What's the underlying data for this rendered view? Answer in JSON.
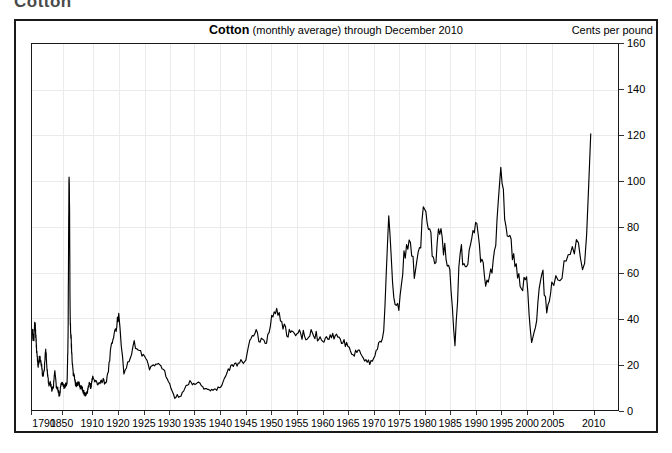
{
  "page": {
    "clipped_heading": "Cotton"
  },
  "chart_frame": {
    "title_series": "Cotton",
    "title_detail": "(monthly average) through December 2010",
    "unit_label": "Cents per pound"
  },
  "chart_data": {
    "type": "line",
    "subtitle": "(monthly average) through December 2010",
    "xlabel": "",
    "ylabel": "Cents per pound",
    "ylim": [
      0,
      160
    ],
    "ytick_step": 20,
    "yticks": [
      0,
      20,
      40,
      60,
      80,
      100,
      120,
      140,
      160
    ],
    "grid": true,
    "grid_color": "#ebebeb",
    "line_color": "#000000",
    "legend": "none",
    "axis_note": "x axis is non-uniform: 1790, 1850, 1910 then every 5 years to 2010",
    "xtick_labels": [
      "1790",
      "1850",
      "1910",
      "1920",
      "1925",
      "1930",
      "1935",
      "1940",
      "1945",
      "1950",
      "1955",
      "1960",
      "1965",
      "1970",
      "1975",
      "1980",
      "1985",
      "1990",
      "1995",
      "2000",
      "2005",
      "2010"
    ],
    "xtick_fractions": [
      0.0,
      0.052,
      0.104,
      0.148,
      0.192,
      0.235,
      0.278,
      0.322,
      0.365,
      0.409,
      0.452,
      0.496,
      0.539,
      0.583,
      0.626,
      0.67,
      0.713,
      0.757,
      0.8,
      0.844,
      0.887,
      0.957
    ],
    "x": [
      1790,
      1793,
      1796,
      1799,
      1802,
      1805,
      1808,
      1811,
      1814,
      1817,
      1820,
      1823,
      1826,
      1829,
      1832,
      1835,
      1838,
      1841,
      1844,
      1847,
      1850,
      1853,
      1856,
      1859,
      1861,
      1862,
      1863,
      1864,
      1865,
      1866,
      1867,
      1869,
      1871,
      1873,
      1876,
      1879,
      1882,
      1885,
      1888,
      1891,
      1894,
      1897,
      1900,
      1903,
      1906,
      1909,
      1910,
      1912,
      1914,
      1915,
      1916,
      1917,
      1918,
      1919,
      1920,
      1921,
      1922,
      1923,
      1924,
      1925,
      1926,
      1927,
      1928,
      1929,
      1930,
      1931,
      1932,
      1933,
      1934,
      1935,
      1936,
      1937,
      1938,
      1939,
      1940,
      1941,
      1942,
      1943,
      1944,
      1945,
      1946,
      1947,
      1948,
      1949,
      1950,
      1951,
      1952,
      1953,
      1954,
      1955,
      1956,
      1957,
      1958,
      1959,
      1960,
      1961,
      1962,
      1963,
      1964,
      1965,
      1966,
      1967,
      1968,
      1969,
      1970,
      1971,
      1972,
      1973,
      1974,
      1975,
      1976,
      1977,
      1978,
      1979,
      1980,
      1981,
      1982,
      1983,
      1984,
      1985,
      1986,
      1987,
      1988,
      1989,
      1990,
      1991,
      1992,
      1993,
      1994,
      1995,
      1996,
      1997,
      1998,
      1999,
      2000,
      2001,
      2002,
      2003,
      2004,
      2005,
      2006,
      2007,
      2008,
      2009,
      2010,
      2010.9
    ],
    "y": [
      36,
      30,
      38,
      27,
      19,
      23,
      21,
      15,
      17,
      27,
      17,
      11,
      12,
      9,
      10,
      17,
      10,
      9,
      6,
      11,
      12,
      10,
      11,
      11,
      31,
      68,
      105,
      88,
      43,
      34,
      31,
      22,
      16,
      15,
      11,
      11,
      12,
      10,
      10,
      8,
      7,
      7,
      9,
      12,
      10,
      14,
      14,
      11,
      13,
      11,
      17,
      27,
      32,
      35,
      42,
      16,
      22,
      29,
      25,
      24,
      18,
      20,
      20,
      17,
      11,
      6,
      6,
      10,
      12,
      11,
      12,
      9,
      8,
      9,
      10,
      15,
      19,
      20,
      21,
      22,
      32,
      33,
      30,
      29,
      40,
      43,
      39,
      33,
      34,
      34,
      33,
      31,
      34,
      32,
      30,
      32,
      32,
      32,
      29,
      29,
      24,
      26,
      23,
      21,
      22,
      28,
      35,
      85,
      50,
      45,
      65,
      78,
      60,
      70,
      88,
      76,
      63,
      78,
      68,
      60,
      27,
      71,
      60,
      74,
      82,
      67,
      56,
      60,
      73,
      107,
      79,
      72,
      62,
      53,
      58,
      29,
      41,
      62,
      44,
      55,
      58,
      70,
      72,
      60,
      136
    ],
    "values_note": "monthly average spot price in US cents per pound; annotated peaks: 1864 Civil War ~105, 1973 ~85, 1980 ~88, 1995 ~107, Dec 2010 ~136; troughs: 1844 ~6, 1931-32 ~6, 1986 ~27, 2001 ~29"
  }
}
